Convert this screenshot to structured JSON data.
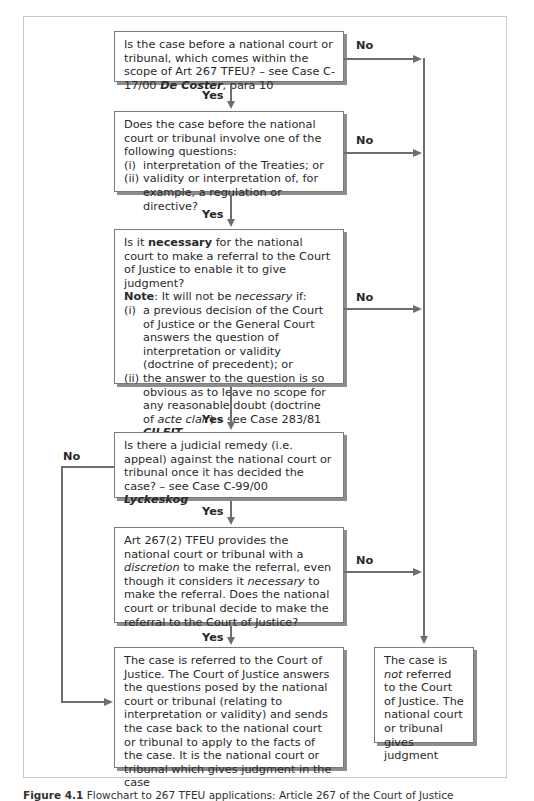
{
  "figure": {
    "caption_label": "Figure 4.1",
    "caption_text": "Flowchart to 267 TFEU applications: Article 267 of the Court of Justice"
  },
  "boxes": {
    "q1": {
      "text_a": "Is the case before a national court or tribunal, which comes within the scope of Art 267 TFEU? – see Case C-17/00 ",
      "case_name": "De Coster",
      "text_b": ", para 10"
    },
    "q2": {
      "intro": "Does the case before the national court or tribunal involve one of the following questions:",
      "items": [
        {
          "num": "(i)",
          "text": "interpretation of the Treaties; or"
        },
        {
          "num": "(ii)",
          "text": "validity or interpretation of, for example, a regulation or directive?"
        }
      ]
    },
    "q3": {
      "text_a": "Is it ",
      "bold_word": "necessary",
      "text_b": " for the national court to make a referral to the Court of Justice to enable it to give judgment?",
      "note_label": "Note",
      "note_a": ": It will not be ",
      "note_italic": "necessary",
      "note_b": " if:",
      "items": [
        {
          "num": "(i)",
          "text": "a previous decision of the Court of Justice or the General Court answers the question of interpretation or validity (doctrine of precedent); or"
        },
        {
          "num": "(ii)",
          "text_a": "the answer to the question is so obvious as to leave no scope for any reasonable doubt (doctrine of ",
          "italic": "acte clair",
          "text_b": ") – see Case 283/81 ",
          "case_name": "CILFIT"
        }
      ]
    },
    "q4": {
      "text_a": "Is there a judicial remedy (i.e. appeal) against the national court or tribunal once it has decided the case? – see Case C-99/00 ",
      "case_name": "Lyckeskog"
    },
    "q5": {
      "text_a": "Art 267(2) TFEU provides the national court or tribunal with a ",
      "italic_a": "discretion",
      "text_b": " to make the referral, even though it considers it ",
      "italic_b": "necessary",
      "text_c": " to make the referral. Does the national court or tribunal decide to make the referral to the Court of Justice?"
    },
    "outcome_referred": {
      "text": "The case is referred to the Court of Justice. The Court of Justice answers the questions posed by the national court or tribunal (relating to interpretation or validity) and sends the case back to the national court or tribunal to apply to the facts of the case. It is the national court or tribunal which gives judgment in the case"
    },
    "outcome_not_referred": {
      "text_a": "The case is ",
      "italic": "not",
      "text_b": " referred to the Court of Justice. The national court or tribunal gives judgment"
    }
  },
  "labels": {
    "yes": "Yes",
    "no": "No"
  },
  "colors": {
    "line": "#6e6e6e",
    "box_border": "#7a7a7a",
    "shadow": "#8d8d8d",
    "frame": "#c9c9c9"
  }
}
